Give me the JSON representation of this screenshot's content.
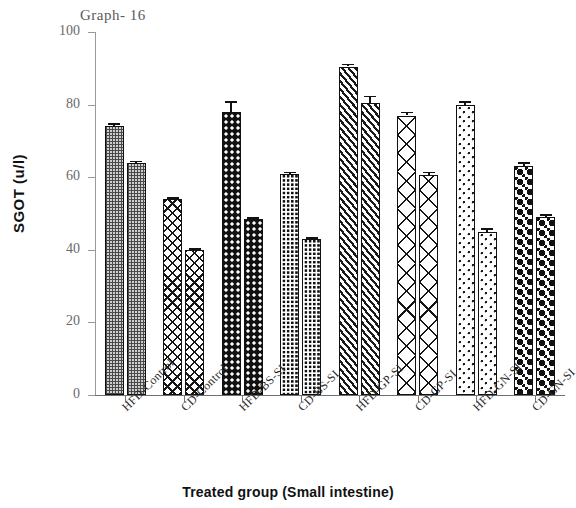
{
  "chart_data": {
    "type": "bar",
    "title": "Graph- 16",
    "xlabel": "Treated group (Small intestine)",
    "ylabel": "SGOT (u/l)",
    "ylim": [
      0,
      100
    ],
    "yticks": [
      0,
      20,
      40,
      60,
      80,
      100
    ],
    "grid": false,
    "legend": "none",
    "categories": [
      "HFD-Control",
      "CD-Control",
      "HFD-BS-SI",
      "CD-BS-SI",
      "HFD-GP-SI",
      "CD-GP-SI",
      "HFD-GN-SI",
      "CD-GN-SI"
    ],
    "series": [
      {
        "name": "Bar 1",
        "values": [
          74,
          54,
          78,
          61,
          90.5,
          77,
          80,
          63
        ],
        "errors": [
          0.8,
          0.5,
          3.0,
          0.5,
          0.8,
          1.0,
          1.0,
          1.2
        ]
      },
      {
        "name": "Bar 2",
        "values": [
          64,
          40,
          48.5,
          43,
          80.5,
          60.5,
          45,
          49
        ],
        "errors": [
          0.5,
          0.5,
          0.5,
          0.5,
          2.0,
          1.0,
          1.0,
          0.8
        ]
      }
    ],
    "bars": [
      {
        "group": "HFD-Control",
        "index": 0,
        "value": 74,
        "error": 0.8,
        "pattern": "fine-gray-check"
      },
      {
        "group": "HFD-Control",
        "index": 1,
        "value": 64,
        "error": 0.5,
        "pattern": "fine-gray-check"
      },
      {
        "group": "CD-Control",
        "index": 0,
        "value": 54,
        "error": 0.5,
        "pattern": "diamond-cross"
      },
      {
        "group": "CD-Control",
        "index": 1,
        "value": 40,
        "error": 0.5,
        "pattern": "diamond-cross"
      },
      {
        "group": "HFD-BS-SI",
        "index": 0,
        "value": 78,
        "error": 3.0,
        "pattern": "black-dots"
      },
      {
        "group": "HFD-BS-SI",
        "index": 1,
        "value": 48.5,
        "error": 0.5,
        "pattern": "black-dots"
      },
      {
        "group": "CD-BS-SI",
        "index": 0,
        "value": 61,
        "error": 0.5,
        "pattern": "black-grid"
      },
      {
        "group": "CD-BS-SI",
        "index": 1,
        "value": 43,
        "error": 0.5,
        "pattern": "black-grid"
      },
      {
        "group": "HFD-GP-SI",
        "index": 0,
        "value": 90.5,
        "error": 0.8,
        "pattern": "diagonal-hatch"
      },
      {
        "group": "HFD-GP-SI",
        "index": 1,
        "value": 80.5,
        "error": 2.0,
        "pattern": "diagonal-hatch"
      },
      {
        "group": "CD-GP-SI",
        "index": 0,
        "value": 77,
        "error": 1.0,
        "pattern": "large-crosshatch"
      },
      {
        "group": "CD-GP-SI",
        "index": 1,
        "value": 60.5,
        "error": 1.0,
        "pattern": "large-crosshatch"
      },
      {
        "group": "HFD-GN-SI",
        "index": 0,
        "value": 80,
        "error": 1.0,
        "pattern": "sparse-dots"
      },
      {
        "group": "HFD-GN-SI",
        "index": 1,
        "value": 45,
        "error": 1.0,
        "pattern": "sparse-dots"
      },
      {
        "group": "CD-GN-SI",
        "index": 0,
        "value": 63,
        "error": 1.2,
        "pattern": "big-black-circles"
      },
      {
        "group": "CD-GN-SI",
        "index": 1,
        "value": 49,
        "error": 0.8,
        "pattern": "big-black-circles"
      }
    ],
    "colors": {
      "ink": "#111111",
      "axis": "#8a8a8a",
      "tick_text": "#6a6a6a",
      "title_text": "#5a5a5a",
      "background": "#ffffff"
    }
  }
}
